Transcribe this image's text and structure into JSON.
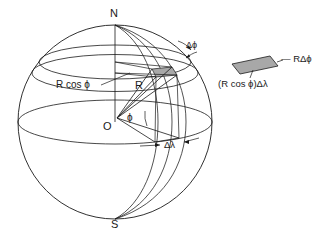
{
  "figure": {
    "background_color": "#ffffff",
    "line_color": "#1a1a1a",
    "patch_fill_color": "#a8a8a8",
    "width": 312,
    "height": 243
  },
  "labels": {
    "north_pole": "N",
    "south_pole": "S",
    "origin": "O",
    "radius": "R",
    "latitude_radius": "R cos ϕ",
    "angle_phi": "ϕ",
    "delta_phi": "Δϕ",
    "delta_lambda": "Δλ"
  },
  "inset": {
    "side_label_top": "— RΔϕ",
    "side_label_bottom": "(R cos ϕ)Δλ",
    "fill_color": "#a8a8a8"
  },
  "geometry": {
    "sphere_center_x": 115,
    "sphere_center_y": 122,
    "sphere_radius": 97,
    "equator_ry": 22,
    "latitude_band_upper_y": 62,
    "latitude_band_lower_y": 72,
    "phi_degrees": 38
  }
}
